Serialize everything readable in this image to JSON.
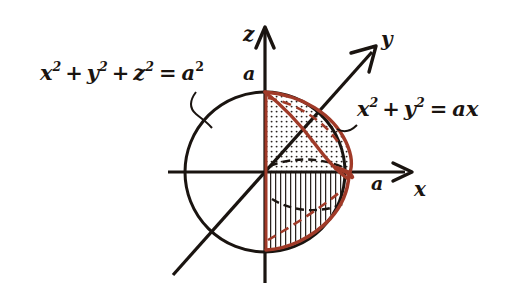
{
  "figure": {
    "background_color": "#ffffff",
    "axis_color": "#1a1410",
    "curve_color": "#a03a28",
    "labels": {
      "sphere_equation": {
        "text": "x² + y² + z² = a²",
        "parts": {
          "x": "x",
          "x_sup": "2",
          "plus1": "+",
          "y": "y",
          "y_sup": "2",
          "plus2": "+",
          "z": "z",
          "z_sup": "2",
          "equals": "=",
          "a": "a",
          "a_sup": "2"
        }
      },
      "cylinder_equation": {
        "text": "x² + y² = ax",
        "parts": {
          "x": "x",
          "x_sup": "2",
          "plus": "+",
          "y": "y",
          "y_sup": "2",
          "equals": "=",
          "a": "a",
          "x2": "x"
        }
      },
      "axis_z": "z",
      "axis_y": "y",
      "axis_x": "x",
      "tick_z": "a",
      "tick_x": "a"
    },
    "regions": {
      "upper": {
        "name": "dotted-region",
        "fill_pattern": "dots"
      },
      "lower": {
        "name": "hatched-region",
        "fill_pattern": "vertical-lines"
      }
    }
  }
}
